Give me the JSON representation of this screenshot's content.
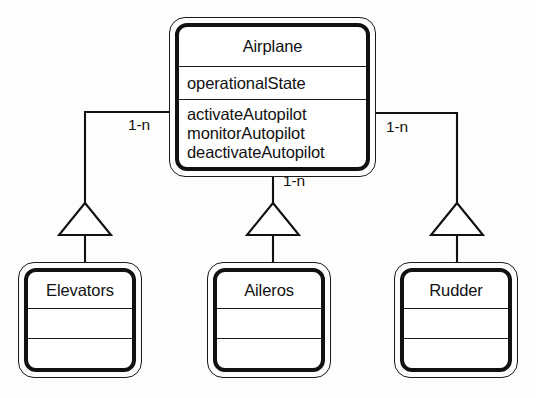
{
  "diagram": {
    "type": "uml-class-diagram",
    "notation": "UML generalization (inheritance) hierarchy",
    "background_color": "#fdfdfb",
    "line_color": "#111111"
  },
  "superclass": {
    "name": "Airplane",
    "attributes": [
      "operationalState"
    ],
    "operations": [
      "activateAutopilot",
      "monitorAutopilot",
      "deactivateAutopilot"
    ]
  },
  "subclasses": [
    {
      "name": "Elevators",
      "attributes": [],
      "operations": []
    },
    {
      "name": "Aileros",
      "attributes": [],
      "operations": []
    },
    {
      "name": "Rudder",
      "attributes": [],
      "operations": []
    }
  ],
  "relationships": [
    {
      "from": "Elevators",
      "to": "Airplane",
      "kind": "generalization",
      "multiplicity": "1-n"
    },
    {
      "from": "Aileros",
      "to": "Airplane",
      "kind": "generalization",
      "multiplicity": "1-n"
    },
    {
      "from": "Rudder",
      "to": "Airplane",
      "kind": "generalization",
      "multiplicity": "1-n"
    }
  ],
  "labels": {
    "multiplicity_left": "1-n",
    "multiplicity_center": "1-n",
    "multiplicity_right": "1-n"
  }
}
